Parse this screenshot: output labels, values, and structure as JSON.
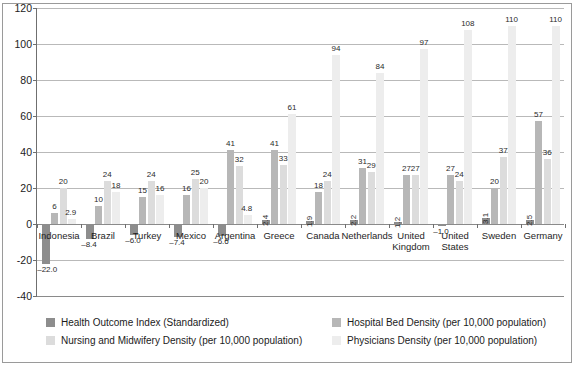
{
  "chart_data": {
    "type": "bar",
    "title": "",
    "subtitle": "",
    "xlabel": "",
    "ylabel": "",
    "ylim": [
      -40,
      120
    ],
    "yticks": [
      -40,
      -20,
      0,
      20,
      40,
      60,
      80,
      100,
      120
    ],
    "ytick_labels": [
      "-40",
      "-20",
      "0",
      "20",
      "40",
      "60",
      "80",
      "100",
      "120"
    ],
    "grid": true,
    "legend_position": "bottom",
    "categories": [
      "Indonesia",
      "Brazil",
      "Turkey",
      "Mexico",
      "Argentina",
      "Greece",
      "Canada",
      "Netherlands",
      "United Kingdom",
      "United States",
      "Sweden",
      "Germany"
    ],
    "series": [
      {
        "name": "Health Outcome Index (Standardized)",
        "color": "#8d8d8d",
        "values": [
          -22.0,
          -8.4,
          -6.0,
          -7.4,
          -6.6,
          2.4,
          1.9,
          2.2,
          1.2,
          -1.0,
          3.1,
          2.5
        ],
        "labels": [
          "–22.0",
          "–8.4",
          "–6.0",
          "–7.4",
          "–6.6",
          "2.4",
          "1.9",
          "2.2",
          "1.2",
          "–1.0",
          "3.1",
          "2.5"
        ]
      },
      {
        "name": "Hospital Bed Density (per 10,000 population)",
        "color": "#b7b7b7",
        "values": [
          6,
          10,
          15,
          16,
          41,
          41,
          18,
          31,
          27,
          27,
          20,
          57
        ],
        "labels": [
          "6",
          "10",
          "15",
          "16",
          "41",
          "41",
          "18",
          "31",
          "27",
          "27",
          "20",
          "57"
        ]
      },
      {
        "name": "Nursing and Midwifery Density (per 10,000 population)",
        "color": "#dcdcdc",
        "values": [
          20,
          24,
          24,
          25,
          32,
          33,
          24,
          29,
          27,
          24,
          37,
          36
        ],
        "labels": [
          "20",
          "24",
          "24",
          "25",
          "32",
          "33",
          "24",
          "29",
          "27",
          "24",
          "37",
          "36"
        ]
      },
      {
        "name": "Physicians Density (per 10,000 population)",
        "color": "#ededed",
        "values": [
          2.9,
          18,
          16,
          20,
          4.8,
          61,
          94,
          84,
          97,
          108,
          110,
          110
        ],
        "labels": [
          "2.9",
          "18",
          "16",
          "20",
          "4.8",
          "61",
          "94",
          "84",
          "97",
          "108",
          "110",
          "110"
        ]
      }
    ]
  },
  "legend": {
    "items": [
      {
        "label": "Health Outcome Index (Standardized)",
        "swatch": "s0"
      },
      {
        "label": "Hospital Bed Density (per 10,000 population)",
        "swatch": "s1"
      },
      {
        "label": "Nursing and Midwifery Density (per 10,000 population)",
        "swatch": "s2"
      },
      {
        "label": "Physicians Density (per 10,000 population)",
        "swatch": "s3"
      }
    ]
  }
}
